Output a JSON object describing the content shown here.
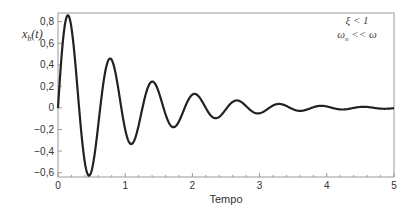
{
  "chart_data": {
    "type": "line",
    "title": "",
    "xlabel": "Tempo",
    "ylabel": "x_h(t)",
    "ylabel_main": "x",
    "ylabel_sub": "h",
    "ylabel_arg": "(t)",
    "xlim": [
      0,
      5
    ],
    "ylim": [
      -0.64,
      0.88
    ],
    "x_ticks": [
      0,
      1,
      2,
      3,
      4,
      5
    ],
    "x_tick_labels": [
      "0",
      "1",
      "2",
      "3",
      "4",
      "5"
    ],
    "y_ticks": [
      -0.6,
      -0.4,
      -0.2,
      0,
      0.2,
      0.4,
      0.6,
      0.8
    ],
    "y_tick_labels": [
      "−0,6",
      "−0,4",
      "−0,2",
      "0",
      "0,2",
      "0,4",
      "0,6",
      "0,8"
    ],
    "grid": false,
    "legend": null,
    "annotations": [
      {
        "text": "ξ < 1",
        "x": 4.45,
        "y": 0.78
      },
      {
        "text": "ω_n << ω",
        "x": 4.45,
        "y": 0.65
      }
    ],
    "series": [
      {
        "name": "x_h(t)",
        "model": "damped oscillation A·e^(-a·t)·sin(ω·t)",
        "amplitude": 1.0,
        "decay": 1.0,
        "omega": 10.0,
        "key_points": [
          {
            "t": 0.0,
            "x": 0.0
          },
          {
            "t": 0.15,
            "x": 0.85
          },
          {
            "t": 0.46,
            "x": -0.62
          },
          {
            "t": 0.78,
            "x": 0.46
          },
          {
            "t": 1.09,
            "x": -0.33
          },
          {
            "t": 1.41,
            "x": 0.25
          },
          {
            "t": 1.72,
            "x": -0.18
          },
          {
            "t": 2.04,
            "x": 0.13
          },
          {
            "t": 2.35,
            "x": -0.09
          },
          {
            "t": 2.67,
            "x": 0.07
          },
          {
            "t": 2.98,
            "x": -0.05
          },
          {
            "t": 3.3,
            "x": 0.04
          },
          {
            "t": 3.61,
            "x": -0.03
          },
          {
            "t": 3.92,
            "x": 0.02
          },
          {
            "t": 5.0,
            "x": 0.0
          }
        ]
      }
    ]
  },
  "colors": {
    "line": "#222222",
    "frame": "#9a9a9a",
    "text": "#333333",
    "background": "#ffffff"
  }
}
